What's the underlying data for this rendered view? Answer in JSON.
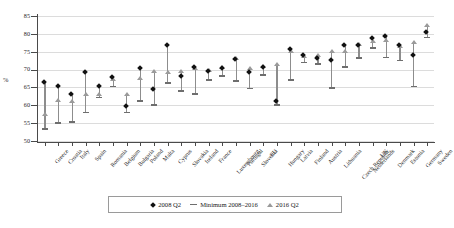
{
  "chart_data": {
    "type": "scatter",
    "title": "",
    "xlabel": "",
    "ylabel": "%",
    "ylim": [
      50,
      85
    ],
    "yticks": [
      50,
      55,
      60,
      65,
      70,
      75,
      80,
      85
    ],
    "grid": true,
    "legend_position": "bottom",
    "categories": [
      "Greece",
      "Croatia",
      "Italy",
      "Spain",
      "Romania",
      "Belgium",
      "Bulgaria",
      "Poland",
      "Malta",
      "Cyprus",
      "Slovakia",
      "Ireland",
      "France",
      "Luxembourg",
      "Portugal",
      "Slovenia",
      "EU",
      "Hungary",
      "Latvia",
      "Finland",
      "Austria",
      "Lithuania",
      "Czech Republic",
      "Netherlands",
      "UK",
      "Denmark",
      "Estonia",
      "Germany",
      "Sweden"
    ],
    "series": [
      {
        "name": "2008 Q2",
        "marker": "diamond",
        "color": "#111111",
        "values": [
          66.6,
          65.3,
          63.2,
          69.2,
          65.3,
          67.8,
          59.7,
          70.4,
          64.7,
          77.0,
          68.3,
          70.6,
          69.7,
          70.4,
          73.1,
          69.3,
          70.6,
          61.3,
          75.8,
          74.0,
          73.2,
          72.6,
          77.0,
          76.8,
          78.8,
          79.5,
          77.0,
          74.0,
          80.5
        ]
      },
      {
        "name": "Minimum 2008–2016",
        "marker": "dash",
        "color": "#6e6e6e",
        "values": [
          53.4,
          55.0,
          55.4,
          58.0,
          62.2,
          65.3,
          58.0,
          61.2,
          60.0,
          66.3,
          64.0,
          63.2,
          67.0,
          68.2,
          66.8,
          64.7,
          68.5,
          60.0,
          67.0,
          72.0,
          71.5,
          64.8,
          70.8,
          73.2,
          76.0,
          73.4,
          72.5,
          65.3,
          79.0
        ]
      },
      {
        "name": "2016 Q2",
        "marker": "triangle",
        "color": "#9a9a9a",
        "values": [
          57.5,
          61.3,
          61.2,
          63.0,
          63.0,
          67.2,
          63.0,
          67.5,
          69.5,
          69.3,
          69.5,
          70.4,
          69.7,
          70.7,
          73.1,
          70.3,
          71.0,
          71.4,
          75.0,
          73.7,
          74.0,
          75.0,
          75.2,
          77.0,
          78.0,
          78.2,
          76.4,
          77.5,
          82.5
        ]
      }
    ]
  },
  "axis": {
    "ylabel": "%",
    "tick_labels": [
      "85",
      "80",
      "75",
      "70",
      "65",
      "60",
      "55",
      "50"
    ]
  },
  "legend": {
    "items": [
      {
        "label": "2008 Q2",
        "icon": "diamond-marker"
      },
      {
        "label": "Minimum 2008–2016",
        "icon": "dash-marker"
      },
      {
        "label": "2016 Q2",
        "icon": "triangle-marker"
      }
    ]
  }
}
